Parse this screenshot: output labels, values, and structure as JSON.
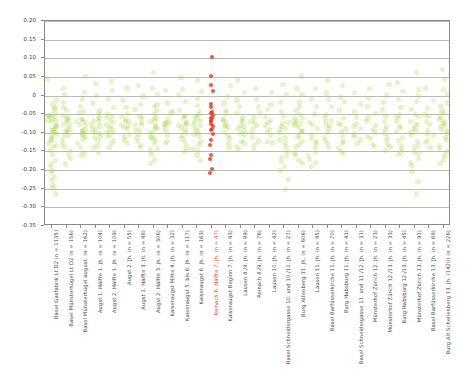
{
  "figure": {
    "title": "",
    "background": "#ffffff",
    "point_color": "#a8d84a",
    "highlight_color": "#e8401c",
    "grid_color": "#b9b9b9",
    "frame_color": "#8a8a8a"
  },
  "chart_data": {
    "type": "scatter",
    "title": "",
    "xlabel": "",
    "ylabel": "",
    "ylim": [
      -0.35,
      0.2
    ],
    "grid": true,
    "legend": null,
    "yticks": [
      0.2,
      0.15,
      0.1,
      0.05,
      0,
      -0.05,
      -0.1,
      -0.15,
      -0.2,
      -0.25,
      -0.3,
      -0.35
    ],
    "ytick_labels": [
      "0.20",
      "0.15",
      "0.10",
      "0.05",
      "0",
      "-0.05",
      "-0.10",
      "-0.15",
      "-0.20",
      "-0.25",
      "-0.30",
      "-0.35"
    ],
    "categories": [
      "Basel Gasfabrik Lt D2 (n = 1135)",
      "Basel Münsterhügel Lt D2 (n = 156)",
      "Basel Münsterhügel august. (n = 162)",
      "Augst 1. Hälfte 1. Jh. (n = 104)",
      "Augst 2. Hälfte 1. Jh. (n = 109)",
      "Augst 2. Jh. (n = 55)",
      "Augst 1. Hälfte 3. Jh. (n = 48)",
      "Augst 2. Hälfte 3. Jh. (n = 306)",
      "Kaiseraugst Mitte 4. Jh. (n = 32)",
      "Kaiseraugst 5. bis 6. Jh. (n = 117)",
      "Kaiseraugst 6. Jh. (n = 163)",
      "Reinach 6. Hälfte 7. Jh. (n = 47)",
      "Kaiseraugst Beginn 7. Jh. (n = 43)",
      "Lausen 8./9. Jh. (n = 89)",
      "Reinach 8./9. Jh. (n = 76)",
      "Lausen 10. Jh. (n = 42)",
      "Basel Schneidergasse 10. und 10./11. Jh. (n = 27)",
      "Burg Altenberg 11. Jh. (n = 606)",
      "Lausen 11. Jh. (n = 45)",
      "Basel Barfüsserkirche 11. Jh. (n = 70)",
      "Burg Habsburg 11. Jh. (n = 41)",
      "Basel Schneidergasse 11. und 11./12. Jh. (n = 31)",
      "Münsterhof Zürich 12. Jh. (n = 23)",
      "Münsterhof Zürich 12./13. Jh. (n = 33)",
      "Burg Habsburg 12./13. Jh. (n = 45)",
      "Münsterhof Zürich 13. Jh. (n = 91)",
      "Basel Barfüsserkirche 13. Jh. (n = 68)",
      "Burg Alt Schellenberg 13. Jh. (1420) (n = 226)"
    ],
    "highlight_index": 11,
    "series": [
      {
        "name": "samples",
        "note": "each category is a vertical jittered strip of sample values",
        "points": [
          {
            "cat": 0,
            "values": [
              0.04,
              -0.01,
              -0.02,
              -0.03,
              -0.04,
              -0.05,
              -0.05,
              -0.06,
              -0.06,
              -0.07,
              -0.07,
              -0.08,
              -0.08,
              -0.09,
              -0.09,
              -0.1,
              -0.1,
              -0.11,
              -0.12,
              -0.13,
              -0.14,
              -0.15,
              -0.16,
              -0.17,
              -0.18,
              -0.19,
              -0.2,
              -0.21,
              -0.22,
              -0.23,
              -0.24,
              -0.25,
              -0.26,
              -0.05,
              -0.07,
              -0.09,
              -0.11,
              -0.06,
              -0.08,
              -0.1,
              -0.12,
              -0.13
            ]
          },
          {
            "cat": 1,
            "values": [
              0.02,
              0.0,
              -0.02,
              -0.03,
              -0.04,
              -0.05,
              -0.06,
              -0.07,
              -0.08,
              -0.09,
              -0.1,
              -0.11,
              -0.12,
              -0.13,
              -0.14,
              -0.15,
              -0.16,
              -0.17,
              -0.18,
              -0.06,
              -0.08,
              -0.09,
              -0.11,
              -0.07,
              -0.1
            ]
          },
          {
            "cat": 2,
            "values": [
              0.05,
              0.01,
              -0.01,
              -0.03,
              -0.04,
              -0.05,
              -0.06,
              -0.07,
              -0.08,
              -0.09,
              -0.1,
              -0.11,
              -0.12,
              -0.13,
              -0.14,
              -0.15,
              -0.16,
              -0.06,
              -0.08,
              -0.09,
              -0.1,
              -0.07,
              -0.11
            ]
          },
          {
            "cat": 3,
            "values": [
              0.03,
              0.0,
              -0.02,
              -0.04,
              -0.05,
              -0.06,
              -0.07,
              -0.08,
              -0.09,
              -0.1,
              -0.11,
              -0.12,
              -0.13,
              -0.14,
              -0.15,
              -0.06,
              -0.08,
              -0.09,
              -0.07,
              -0.1,
              -0.11
            ]
          },
          {
            "cat": 4,
            "values": [
              0.04,
              0.01,
              -0.01,
              -0.03,
              -0.05,
              -0.06,
              -0.07,
              -0.08,
              -0.09,
              -0.1,
              -0.11,
              -0.12,
              -0.13,
              -0.14,
              -0.06,
              -0.08,
              -0.09,
              -0.07,
              -0.1
            ]
          },
          {
            "cat": 5,
            "values": [
              0.02,
              -0.01,
              -0.03,
              -0.05,
              -0.06,
              -0.07,
              -0.08,
              -0.09,
              -0.1,
              -0.11,
              -0.12,
              -0.13,
              -0.06,
              -0.08,
              -0.09,
              -0.07
            ]
          },
          {
            "cat": 6,
            "values": [
              0.03,
              0.0,
              -0.02,
              -0.04,
              -0.06,
              -0.07,
              -0.08,
              -0.09,
              -0.1,
              -0.11,
              -0.12,
              -0.13,
              -0.14,
              -0.06,
              -0.08,
              -0.09
            ]
          },
          {
            "cat": 7,
            "values": [
              0.06,
              0.02,
              0.0,
              -0.02,
              -0.03,
              -0.04,
              -0.05,
              -0.06,
              -0.07,
              -0.08,
              -0.09,
              -0.1,
              -0.11,
              -0.12,
              -0.13,
              -0.14,
              -0.15,
              -0.16,
              -0.17,
              -0.18,
              -0.06,
              -0.08,
              -0.09,
              -0.07,
              -0.1,
              -0.11,
              -0.12
            ]
          },
          {
            "cat": 8,
            "values": [
              0.01,
              -0.02,
              -0.04,
              -0.05,
              -0.06,
              -0.07,
              -0.08,
              -0.09,
              -0.1,
              -0.11,
              -0.12,
              -0.13,
              -0.07,
              -0.08
            ]
          },
          {
            "cat": 9,
            "values": [
              0.05,
              0.02,
              0.0,
              -0.02,
              -0.04,
              -0.05,
              -0.06,
              -0.07,
              -0.08,
              -0.09,
              -0.1,
              -0.11,
              -0.12,
              -0.13,
              -0.14,
              -0.15,
              -0.06,
              -0.08,
              -0.09,
              -0.07
            ]
          },
          {
            "cat": 10,
            "values": [
              0.04,
              0.01,
              -0.01,
              -0.03,
              -0.04,
              -0.05,
              -0.06,
              -0.07,
              -0.08,
              -0.09,
              -0.1,
              -0.11,
              -0.12,
              -0.13,
              -0.14,
              -0.15,
              -0.16,
              -0.17,
              -0.06,
              -0.08,
              -0.09,
              -0.07,
              -0.1
            ]
          },
          {
            "cat": 11,
            "values": [
              0.1,
              0.05,
              0.03,
              0.01,
              -0.02,
              -0.03,
              -0.04,
              -0.05,
              -0.05,
              -0.06,
              -0.06,
              -0.07,
              -0.07,
              -0.08,
              -0.08,
              -0.09,
              -0.09,
              -0.1,
              -0.12,
              -0.13,
              -0.16,
              -0.17,
              -0.2,
              -0.21
            ]
          },
          {
            "cat": 12,
            "values": [
              0.03,
              0.0,
              -0.02,
              -0.04,
              -0.05,
              -0.06,
              -0.07,
              -0.08,
              -0.09,
              -0.1,
              -0.11,
              -0.12,
              -0.13,
              -0.14,
              -0.07,
              -0.08
            ]
          },
          {
            "cat": 13,
            "values": [
              0.04,
              0.01,
              -0.01,
              -0.03,
              -0.05,
              -0.06,
              -0.07,
              -0.08,
              -0.09,
              -0.1,
              -0.11,
              -0.12,
              -0.13,
              -0.14,
              -0.15,
              -0.07,
              -0.08,
              -0.09
            ]
          },
          {
            "cat": 14,
            "values": [
              0.02,
              -0.01,
              -0.03,
              -0.05,
              -0.06,
              -0.07,
              -0.08,
              -0.09,
              -0.1,
              -0.11,
              -0.12,
              -0.13,
              -0.14,
              -0.07
            ]
          },
          {
            "cat": 15,
            "values": [
              0.01,
              -0.02,
              -0.04,
              -0.06,
              -0.07,
              -0.08,
              -0.09,
              -0.1,
              -0.11,
              -0.12,
              -0.13,
              -0.07
            ]
          },
          {
            "cat": 16,
            "values": [
              0.03,
              0.0,
              -0.02,
              -0.04,
              -0.06,
              -0.07,
              -0.08,
              -0.09,
              -0.1,
              -0.11,
              -0.12,
              -0.13,
              -0.14,
              -0.15,
              -0.16,
              -0.17,
              -0.18,
              -0.19,
              -0.2,
              -0.23,
              -0.25,
              -0.08,
              -0.09
            ]
          },
          {
            "cat": 17,
            "values": [
              0.05,
              0.02,
              0.0,
              -0.02,
              -0.03,
              -0.04,
              -0.05,
              -0.06,
              -0.07,
              -0.08,
              -0.09,
              -0.1,
              -0.11,
              -0.12,
              -0.13,
              -0.14,
              -0.15,
              -0.16,
              -0.17,
              -0.18,
              -0.06,
              -0.08,
              -0.09,
              -0.07,
              -0.1,
              -0.11
            ]
          },
          {
            "cat": 18,
            "values": [
              0.02,
              -0.01,
              -0.03,
              -0.05,
              -0.07,
              -0.08,
              -0.09,
              -0.1,
              -0.11,
              -0.12,
              -0.13,
              -0.14,
              -0.15,
              -0.16,
              -0.17,
              -0.18,
              -0.19
            ]
          },
          {
            "cat": 19,
            "values": [
              0.04,
              0.01,
              -0.01,
              -0.03,
              -0.05,
              -0.06,
              -0.07,
              -0.08,
              -0.09,
              -0.1,
              -0.11,
              -0.12,
              -0.13,
              -0.14,
              -0.07,
              -0.08
            ]
          },
          {
            "cat": 20,
            "values": [
              0.03,
              0.0,
              -0.02,
              -0.04,
              -0.06,
              -0.07,
              -0.08,
              -0.09,
              -0.1,
              -0.11,
              -0.12,
              -0.13,
              -0.14,
              -0.15,
              -0.16
            ]
          },
          {
            "cat": 21,
            "values": [
              0.01,
              -0.02,
              -0.04,
              -0.06,
              -0.07,
              -0.08,
              -0.09,
              -0.1,
              -0.11,
              -0.12,
              -0.13
            ]
          },
          {
            "cat": 22,
            "values": [
              0.02,
              -0.01,
              -0.03,
              -0.05,
              -0.06,
              -0.07,
              -0.08,
              -0.09,
              -0.1,
              -0.11,
              -0.12,
              -0.13,
              -0.14
            ]
          },
          {
            "cat": 23,
            "values": [
              0.03,
              0.0,
              -0.02,
              -0.04,
              -0.06,
              -0.07,
              -0.08,
              -0.09,
              -0.1,
              -0.11,
              -0.12,
              -0.13,
              -0.14,
              -0.15
            ]
          },
          {
            "cat": 24,
            "values": [
              0.04,
              0.01,
              -0.01,
              -0.03,
              -0.05,
              -0.06,
              -0.07,
              -0.08,
              -0.09,
              -0.1,
              -0.11,
              -0.12,
              -0.13,
              -0.14,
              -0.15,
              -0.16
            ]
          },
          {
            "cat": 25,
            "values": [
              0.06,
              0.02,
              0.0,
              -0.02,
              -0.04,
              -0.05,
              -0.06,
              -0.07,
              -0.08,
              -0.09,
              -0.1,
              -0.11,
              -0.12,
              -0.13,
              -0.14,
              -0.15,
              -0.16,
              -0.17,
              -0.18,
              -0.19,
              -0.2,
              -0.23,
              -0.26,
              -0.08,
              -0.09
            ]
          },
          {
            "cat": 26,
            "values": [
              0.02,
              -0.01,
              -0.03,
              -0.05,
              -0.06,
              -0.07,
              -0.08,
              -0.09,
              -0.1,
              -0.11,
              -0.12,
              -0.13,
              -0.14
            ]
          },
          {
            "cat": 27,
            "values": [
              0.07,
              0.04,
              0.02,
              0.0,
              -0.02,
              -0.03,
              -0.04,
              -0.05,
              -0.06,
              -0.07,
              -0.08,
              -0.09,
              -0.1,
              -0.11,
              -0.12,
              -0.13,
              -0.14,
              -0.15,
              -0.16,
              -0.17,
              -0.18,
              -0.06,
              -0.08,
              -0.09,
              -0.07
            ]
          }
        ]
      }
    ]
  }
}
